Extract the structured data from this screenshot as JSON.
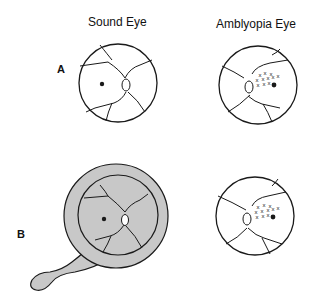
{
  "headers": {
    "sound_eye": "Sound Eye",
    "amblyopia_eye": "Amblyopia Eye"
  },
  "panels": [
    {
      "letter": "A",
      "description": "Sound eye fundus with central fixation; amblyopic eye with eccentric fixation area marked by x's"
    },
    {
      "letter": "B",
      "description": "Sound eye occluded by patch (gray); amblyopic eye with eccentric fixation area marked by x's"
    }
  ],
  "colors": {
    "line": "#1a1a1a",
    "occluder_fill": "#c8c8c8",
    "background": "#ffffff"
  },
  "symbols": {
    "fovea": "filled dot",
    "optic_disc": "small oval",
    "eccentric_fixation_marks": "x"
  },
  "x_mark": "x"
}
